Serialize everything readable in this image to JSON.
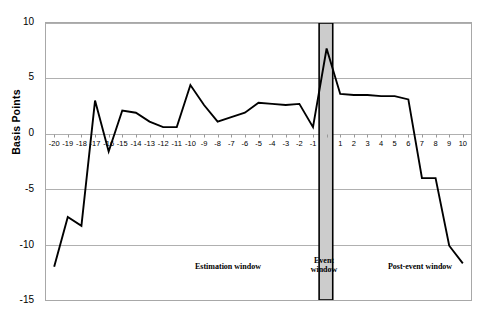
{
  "chart_data": {
    "type": "line",
    "title": "",
    "subtitle": "",
    "xlabel": "",
    "ylabel": "Basis Points",
    "ylim": [
      -15,
      10
    ],
    "ytick_values": [
      10,
      5,
      0,
      -5,
      -10,
      -15
    ],
    "ytick_labels": [
      "10",
      "5",
      "0",
      "-5",
      "-10",
      "-15"
    ],
    "grid": true,
    "legend_position": "none",
    "x": [
      -20,
      -19,
      -18,
      -17,
      -16,
      -15,
      -14,
      -13,
      -12,
      -11,
      -10,
      -9,
      -8,
      -7,
      -6,
      -5,
      -4,
      -3,
      -2,
      -1,
      0,
      1,
      2,
      3,
      4,
      5,
      6,
      7,
      8,
      9,
      10
    ],
    "xtick_labels": [
      "-20",
      "-19",
      "-18",
      "-17",
      "-16",
      "-15",
      "-14",
      "-13",
      "-12",
      "-11",
      "-10",
      "-9",
      "-8",
      "-7",
      "-6",
      "-5",
      "-4",
      "-3",
      "-2",
      "-1",
      "",
      "1",
      "2",
      "3",
      "4",
      "5",
      "6",
      "7",
      "8",
      "9",
      "10"
    ],
    "values": [
      -12.0,
      -7.5,
      -8.3,
      3.0,
      -1.6,
      2.1,
      1.9,
      1.1,
      0.6,
      0.6,
      4.4,
      2.6,
      1.1,
      1.5,
      1.9,
      2.8,
      2.7,
      2.6,
      2.7,
      0.6,
      7.7,
      3.6,
      3.5,
      3.5,
      3.4,
      3.4,
      3.1,
      -4.0,
      -4.0,
      -10.1,
      -11.7
    ],
    "series_name": "Basis Points",
    "line_color": "#000000",
    "grid_color": "#b0b0b0",
    "plot_border_color": "#a8a8a8",
    "event_window_fill": "#cccccc",
    "event_window_border": "#000000",
    "event_window_x_range": [
      -0.55,
      0.45
    ],
    "annotations": [
      {
        "name": "estimation-window",
        "text": "Estimation window"
      },
      {
        "name": "event-window",
        "text": "Event\nwindow",
        "line1": "Event",
        "line2": "window"
      },
      {
        "name": "post-event-window",
        "text": "Post-event window"
      }
    ]
  }
}
